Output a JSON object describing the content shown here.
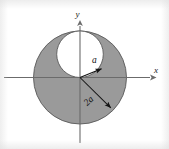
{
  "figure": {
    "background_color": "#ffffff",
    "shaded_fill": "#9a9a9a",
    "inner_fill": "#ffffff",
    "stroke_color": "#595959",
    "axis_color": "#6b6b6b",
    "arrow_color": "#1a1a1a",
    "text_color": "#111111",
    "axes": {
      "x_label": "x",
      "y_label": "y",
      "origin_x": 80,
      "origin_y": 77.5
    },
    "shapes": [
      {
        "name": "outer-circle",
        "type": "circle",
        "center_x": 80,
        "center_y": 77.5,
        "radius": 46.5,
        "fill": "#9a9a9a"
      },
      {
        "name": "inner-circle",
        "type": "circle",
        "center_x": 80,
        "center_y": 54.2,
        "radius": 23.3,
        "fill": "#ffffff"
      }
    ],
    "dimensions": [
      {
        "name": "inner-radius",
        "label": "a",
        "from_x": 80,
        "from_y": 77.5,
        "to_x": 103.5,
        "to_y": 68.0,
        "label_x": 93,
        "label_y": 62,
        "rotation": 0
      },
      {
        "name": "outer-radius",
        "label": "2a",
        "from_x": 80,
        "from_y": 77.5,
        "to_x": 113.5,
        "to_y": 110.5,
        "label_x": 89,
        "label_y": 101,
        "rotation": -45
      }
    ]
  }
}
